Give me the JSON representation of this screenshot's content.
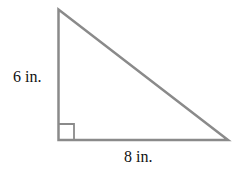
{
  "figure": {
    "type": "right-triangle",
    "stroke_color": "#8a8a8a",
    "vertical_leg_label": "6 in.",
    "horizontal_leg_label": "8 in.",
    "right_angle_marker": true
  }
}
